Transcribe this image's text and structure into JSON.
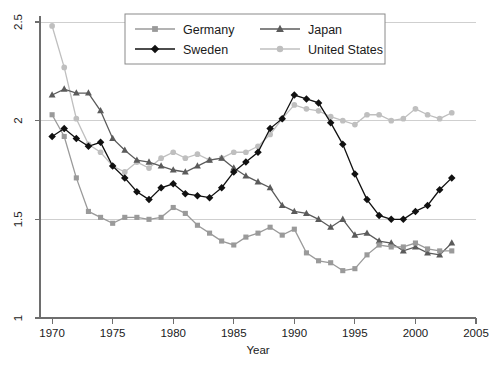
{
  "chart_data": {
    "type": "line",
    "title": "",
    "xlabel": "Year",
    "ylabel": "",
    "xlim": [
      1969,
      2005
    ],
    "ylim": [
      1,
      2.5
    ],
    "xticks": [
      1970,
      1975,
      1980,
      1985,
      1990,
      1995,
      2000,
      2005
    ],
    "yticks": [
      1,
      1.5,
      2,
      2.5
    ],
    "xtick_labels": [
      "1970",
      "1975",
      "1980",
      "1985",
      "1990",
      "1995",
      "2000",
      "2005"
    ],
    "ytick_labels": [
      "1",
      "1.5",
      "2",
      "2.5"
    ],
    "grid": true,
    "legend_position": "top-center",
    "x": [
      1970,
      1971,
      1972,
      1973,
      1974,
      1975,
      1976,
      1977,
      1978,
      1979,
      1980,
      1981,
      1982,
      1983,
      1984,
      1985,
      1986,
      1987,
      1988,
      1989,
      1990,
      1991,
      1992,
      1993,
      1994,
      1995,
      1996,
      1997,
      1998,
      1999,
      2000,
      2001,
      2002,
      2003
    ],
    "series": [
      {
        "name": "Germany",
        "color": "#9a9a9a",
        "marker": "square",
        "values": [
          2.03,
          1.92,
          1.71,
          1.54,
          1.51,
          1.48,
          1.51,
          1.51,
          1.5,
          1.51,
          1.56,
          1.53,
          1.47,
          1.43,
          1.39,
          1.37,
          1.41,
          1.43,
          1.46,
          1.42,
          1.45,
          1.33,
          1.29,
          1.28,
          1.24,
          1.25,
          1.32,
          1.37,
          1.36,
          1.36,
          1.38,
          1.35,
          1.34,
          1.34
        ]
      },
      {
        "name": "Japan",
        "color": "#5b5b5b",
        "marker": "triangle",
        "values": [
          2.13,
          2.16,
          2.14,
          2.14,
          2.05,
          1.91,
          1.85,
          1.8,
          1.79,
          1.77,
          1.75,
          1.74,
          1.77,
          1.8,
          1.81,
          1.76,
          1.72,
          1.69,
          1.66,
          1.57,
          1.54,
          1.53,
          1.5,
          1.46,
          1.5,
          1.42,
          1.43,
          1.39,
          1.38,
          1.34,
          1.36,
          1.33,
          1.32,
          1.38
        ]
      },
      {
        "name": "Sweden",
        "color": "#111111",
        "marker": "diamond",
        "values": [
          1.92,
          1.96,
          1.91,
          1.87,
          1.89,
          1.77,
          1.71,
          1.64,
          1.6,
          1.66,
          1.68,
          1.63,
          1.62,
          1.61,
          1.66,
          1.74,
          1.79,
          1.84,
          1.96,
          2.01,
          2.13,
          2.11,
          2.09,
          1.99,
          1.88,
          1.73,
          1.6,
          1.52,
          1.5,
          1.5,
          1.54,
          1.57,
          1.65,
          1.71
        ]
      },
      {
        "name": "United States",
        "color": "#bfbfbf",
        "marker": "circle",
        "values": [
          2.48,
          2.27,
          2.01,
          1.88,
          1.84,
          1.77,
          1.74,
          1.79,
          1.76,
          1.81,
          1.84,
          1.81,
          1.83,
          1.8,
          1.81,
          1.84,
          1.84,
          1.87,
          1.93,
          2.01,
          2.08,
          2.06,
          2.05,
          2.02,
          2.0,
          1.98,
          2.03,
          2.03,
          2.0,
          2.01,
          2.06,
          2.03,
          2.01,
          2.04
        ]
      }
    ]
  },
  "legend": {
    "entries": [
      {
        "label": "Germany"
      },
      {
        "label": "Japan"
      },
      {
        "label": "Sweden"
      },
      {
        "label": "United States"
      }
    ]
  },
  "axes": {
    "x_title": "Year"
  }
}
